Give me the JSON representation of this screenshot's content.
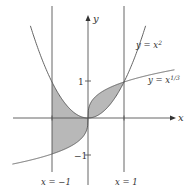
{
  "figure": {
    "type": "area-between-curves",
    "axes": {
      "x_label": "x",
      "y_label": "y",
      "y_ticks": [
        {
          "value": 1,
          "label": "1"
        },
        {
          "value": -1,
          "label": "−1"
        }
      ]
    },
    "curves": [
      {
        "name": "parabola",
        "label": "y = x²",
        "equation": "y = x^2"
      },
      {
        "name": "cube-root",
        "label": "y = x¹ᐟ³",
        "equation": "y = x^(1/3)"
      }
    ],
    "vertical_lines": [
      {
        "name": "left-bound",
        "label": "x = −1",
        "x": -1
      },
      {
        "name": "right-bound",
        "label": "x = 1",
        "x": 1
      }
    ],
    "shaded_regions": [
      {
        "from": -1,
        "to": 0,
        "between": [
          "y = x^2",
          "y = x^(1/3)"
        ]
      },
      {
        "from": 0,
        "to": 1,
        "between": [
          "y = x^2",
          "y = x^(1/3)"
        ]
      }
    ],
    "colors": {
      "line": "#555555",
      "shade": "#b8b8b8"
    }
  },
  "labels": {
    "y_axis": "y",
    "x_axis": "x",
    "tick_pos1": "1",
    "tick_neg1": "−1",
    "curve_parabola_base": "y = x",
    "curve_parabola_exp": "2",
    "curve_cuberoot_base": "y = x",
    "curve_cuberoot_exp": "1/3",
    "line_left": "x = −1",
    "line_right": "x = 1"
  }
}
